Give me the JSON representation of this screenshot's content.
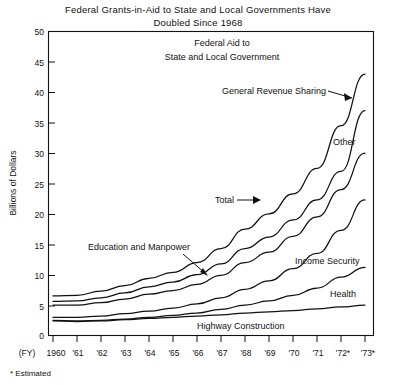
{
  "chart_data": {
    "type": "line",
    "title": "Federal Grants-in-Aid to State and Local Governments Have Doubled Since 1968",
    "title_line1": "Federal Grants-in-Aid to State and Local Governments Have",
    "title_line2": "Doubled Since 1968",
    "inner_title_line1": "Federal Aid to",
    "inner_title_line2": "State and Local Government",
    "xlabel": "(FY)",
    "ylabel": "Billions of Dollars",
    "footnote": "* Estimated",
    "grid": false,
    "legend_position": "inline-annotations",
    "ylim": [
      0,
      50
    ],
    "yticks": [
      0,
      5,
      10,
      15,
      20,
      25,
      30,
      35,
      40,
      45,
      50
    ],
    "ytick_labels": [
      "0",
      "5",
      "10",
      "15",
      "20",
      "25",
      "30",
      "35",
      "40",
      "45",
      "50"
    ],
    "categories": [
      "1960",
      "'61",
      "'62",
      "'63",
      "'64",
      "'65",
      "'66",
      "'67",
      "'68",
      "'69",
      "'70",
      "'71",
      "'72*",
      "'73*"
    ],
    "x": [
      1960,
      1961,
      1962,
      1963,
      1964,
      1965,
      1966,
      1967,
      1968,
      1969,
      1970,
      1971,
      1972,
      1973
    ],
    "series": [
      {
        "name": "Total",
        "label": "Total",
        "values": [
          6.5,
          6.6,
          7.3,
          8.2,
          9.4,
          10.4,
          12.0,
          14.3,
          17.5,
          20.0,
          23.3,
          27.5,
          34.5,
          43.0
        ]
      },
      {
        "name": "Other",
        "label": "Other",
        "values": [
          5.6,
          5.7,
          6.2,
          7.0,
          8.0,
          8.8,
          10.0,
          11.8,
          14.3,
          16.2,
          19.0,
          22.3,
          27.0,
          37.0
        ]
      },
      {
        "name": "Education and Manpower",
        "label": "Education and Manpower",
        "values": [
          5.0,
          5.0,
          5.4,
          6.0,
          6.8,
          7.4,
          8.4,
          9.9,
          12.0,
          13.7,
          16.3,
          19.5,
          24.0,
          30.0
        ]
      },
      {
        "name": "Income Security",
        "label": "Income Security",
        "values": [
          3.0,
          3.0,
          3.2,
          3.6,
          4.0,
          4.5,
          5.2,
          6.2,
          7.6,
          9.0,
          11.0,
          13.5,
          17.3,
          22.3
        ]
      },
      {
        "name": "Health",
        "label": "Health",
        "values": [
          2.5,
          2.4,
          2.5,
          2.7,
          3.0,
          3.3,
          3.7,
          4.3,
          5.0,
          5.7,
          6.6,
          7.8,
          9.6,
          11.2
        ]
      },
      {
        "name": "Highway Construction",
        "label": "Highway Construction",
        "values": [
          2.4,
          2.3,
          2.4,
          2.6,
          2.8,
          3.0,
          3.2,
          3.4,
          3.7,
          3.9,
          4.1,
          4.4,
          4.7,
          5.0
        ]
      }
    ],
    "annotations": [
      {
        "text": "General Revenue Sharing",
        "note": "arrow points to wedge between Total and Other at right edge"
      },
      {
        "text": "Other",
        "note": "label on Other band"
      },
      {
        "text": "Total",
        "note": "arrow points to Total line"
      },
      {
        "text": "Education and Manpower",
        "note": "arrow points to Education and Manpower line"
      },
      {
        "text": "Income Security",
        "note": "label on Income Security line"
      },
      {
        "text": "Health",
        "note": "label on Health line"
      },
      {
        "text": "Highway Construction",
        "note": "label on Highway Construction line"
      }
    ]
  }
}
